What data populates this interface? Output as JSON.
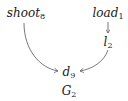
{
  "diagram": {
    "title": {
      "base": "G",
      "sub": "2"
    },
    "nodes": [
      {
        "id": "shoot8",
        "base": "shoot",
        "sub": "8"
      },
      {
        "id": "load1",
        "base": "load",
        "sub": "1"
      },
      {
        "id": "l2",
        "base": "l",
        "sub": "2"
      },
      {
        "id": "d9",
        "base": "d",
        "sub": "9"
      }
    ],
    "edges": [
      {
        "from": "load1",
        "to": "l2"
      },
      {
        "from": "shoot8",
        "to": "d9"
      },
      {
        "from": "l2",
        "to": "d9"
      }
    ],
    "colors": {
      "stroke": "#555555",
      "text": "#1a1a1a"
    }
  }
}
